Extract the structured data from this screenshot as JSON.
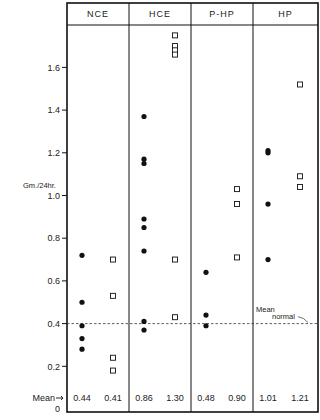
{
  "chart_data": {
    "type": "scatter",
    "title": "",
    "xlabel": "",
    "ylabel": "Gm./24hr.",
    "ylim": [
      0,
      1.8
    ],
    "yticks": [
      0,
      0.2,
      0.4,
      0.6,
      0.8,
      1.0,
      1.2,
      1.4,
      1.6
    ],
    "ytick_labels": [
      "0",
      "0.2",
      "0.4",
      "0.6",
      "0.8",
      "1.0",
      "1.2",
      "1.4",
      "1.6"
    ],
    "grid": false,
    "categories": [
      "NCE",
      "HCE",
      "P-HP",
      "HP"
    ],
    "reference_line": {
      "value": 0.4,
      "label_line1": "Mean",
      "label_line2": "normal",
      "style": "dashed"
    },
    "mean_row_label": "Mean",
    "series": [
      {
        "name": "filled-circle",
        "marker": "circle-filled",
        "groups": [
          {
            "category": "NCE",
            "values": [
              0.72,
              0.5,
              0.39,
              0.33,
              0.28
            ],
            "mean": "0.44"
          },
          {
            "category": "HCE",
            "values": [
              1.37,
              1.17,
              1.15,
              0.89,
              0.85,
              0.74,
              0.41,
              0.37
            ],
            "mean": "0.86"
          },
          {
            "category": "P-HP",
            "values": [
              0.64,
              0.44,
              0.39
            ],
            "mean": "0.48"
          },
          {
            "category": "HP",
            "values": [
              1.21,
              1.2,
              0.96,
              0.7
            ],
            "mean": "1.01"
          }
        ]
      },
      {
        "name": "open-square",
        "marker": "square-open",
        "groups": [
          {
            "category": "NCE",
            "values": [
              0.7,
              0.53,
              0.24,
              0.18
            ],
            "mean": "0.41"
          },
          {
            "category": "HCE",
            "values": [
              1.75,
              1.7,
              1.68,
              1.66,
              0.7,
              0.43
            ],
            "mean": "1.30"
          },
          {
            "category": "P-HP",
            "values": [
              1.03,
              0.96,
              0.71
            ],
            "mean": "0.90"
          },
          {
            "category": "HP",
            "values": [
              1.52,
              1.09,
              1.04
            ],
            "mean": "1.21"
          }
        ]
      }
    ]
  },
  "layout": {
    "plot_left": 67,
    "plot_right": 318,
    "plot_top": 3,
    "header_bottom": 25,
    "plot_bottom": 412,
    "zero_y": 409,
    "px_per_unit": 213.5,
    "group_dividers": [
      129,
      191,
      253
    ],
    "dot_x": [
      82,
      144,
      206,
      268
    ],
    "square_x": [
      113,
      175,
      237,
      300
    ],
    "mean_y": 398
  }
}
